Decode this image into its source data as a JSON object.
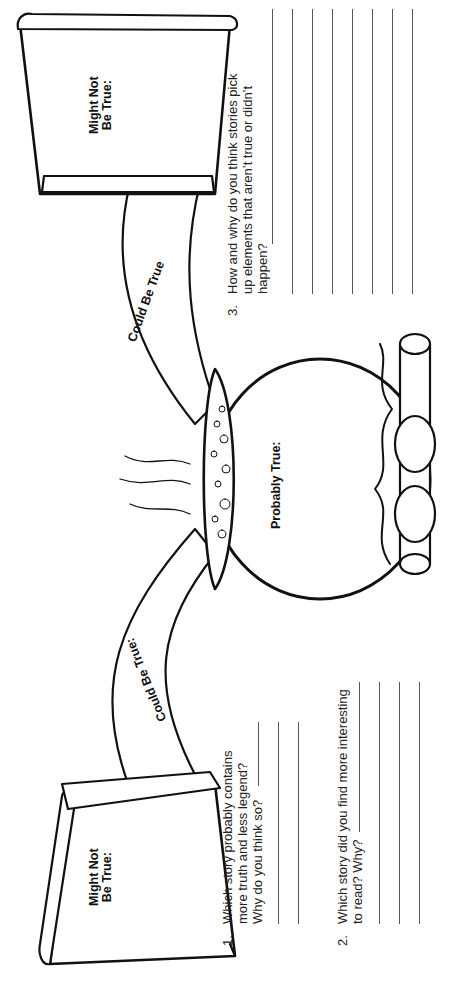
{
  "worksheet": {
    "labels": {
      "might_not_left": [
        "Might Not",
        "Be True:"
      ],
      "could_left": "Could Be True:",
      "probably": "Probably True:",
      "could_right": "Could Be True",
      "might_not_right": [
        "Might Not",
        "Be True:"
      ]
    },
    "questions": [
      {
        "number": "1.",
        "lines": [
          "Which story probably contains",
          "more truth and less legend?",
          "Why do you think so?"
        ],
        "answer_lines": 3
      },
      {
        "number": "2.",
        "lines": [
          "Which story did you find more interesting",
          "to read? Why?"
        ],
        "answer_lines": 4
      },
      {
        "number": "3.",
        "lines": [
          "How and why do you think stories pick",
          "up elements that aren’t true or didn’t",
          "happen?"
        ],
        "answer_lines": 6
      }
    ]
  }
}
